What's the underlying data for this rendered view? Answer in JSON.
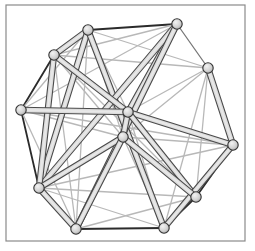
{
  "figure": {
    "background_color": "#ffffff",
    "frame": {
      "stroke_color": "#8a8a8a",
      "stroke_width": 1.2,
      "x": 6,
      "y": 5,
      "width": 239,
      "height": 236
    },
    "canvas": {
      "width": 255,
      "height": 251
    }
  },
  "style": {
    "node_fill": "#d2d2d2",
    "node_stroke": "#333333",
    "node_radius": 5.2,
    "node_stroke_width": 1.1,
    "edge_dark": "#2b2b2b",
    "edge_mid": "#777777",
    "edge_light": "#b8b8b8",
    "edge_highlight": "#e8e8e8",
    "edge_thick_width": 6.5,
    "edge_thin_width": 1.3
  },
  "graph_data": {
    "type": "graph",
    "node_count": 12,
    "edge_count": 44,
    "nodes": [
      {
        "id": "n0",
        "label": "0",
        "x": 88,
        "y": 30
      },
      {
        "id": "n1",
        "label": "1",
        "x": 177,
        "y": 24
      },
      {
        "id": "n2",
        "label": "2",
        "x": 54,
        "y": 55
      },
      {
        "id": "n3",
        "label": "3",
        "x": 208,
        "y": 68
      },
      {
        "id": "n4",
        "label": "4",
        "x": 21,
        "y": 110
      },
      {
        "id": "n5",
        "label": "5",
        "x": 128,
        "y": 112
      },
      {
        "id": "n6",
        "label": "6",
        "x": 123,
        "y": 137
      },
      {
        "id": "n7",
        "label": "7",
        "x": 233,
        "y": 145
      },
      {
        "id": "n8",
        "label": "8",
        "x": 39,
        "y": 188
      },
      {
        "id": "n9",
        "label": "9",
        "x": 196,
        "y": 197
      },
      {
        "id": "n10",
        "label": "10",
        "x": 76,
        "y": 229
      },
      {
        "id": "n11",
        "label": "11",
        "x": 164,
        "y": 228
      }
    ],
    "edges": [
      {
        "from": "n0",
        "to": "n1",
        "tone": "dark",
        "weight": "thin"
      },
      {
        "from": "n0",
        "to": "n2",
        "tone": "mid",
        "weight": "thick"
      },
      {
        "from": "n2",
        "to": "n4",
        "tone": "dark",
        "weight": "thin"
      },
      {
        "from": "n4",
        "to": "n8",
        "tone": "dark",
        "weight": "thin"
      },
      {
        "from": "n8",
        "to": "n10",
        "tone": "mid",
        "weight": "thick"
      },
      {
        "from": "n10",
        "to": "n11",
        "tone": "dark",
        "weight": "thin"
      },
      {
        "from": "n11",
        "to": "n9",
        "tone": "dark",
        "weight": "thin"
      },
      {
        "from": "n9",
        "to": "n7",
        "tone": "dark",
        "weight": "thin"
      },
      {
        "from": "n7",
        "to": "n3",
        "tone": "mid",
        "weight": "thick"
      },
      {
        "from": "n3",
        "to": "n1",
        "tone": "mid",
        "weight": "thin"
      },
      {
        "from": "n0",
        "to": "n3",
        "tone": "light",
        "weight": "thin"
      },
      {
        "from": "n0",
        "to": "n5",
        "tone": "light",
        "weight": "thin"
      },
      {
        "from": "n0",
        "to": "n6",
        "tone": "light",
        "weight": "thin"
      },
      {
        "from": "n0",
        "to": "n8",
        "tone": "mid",
        "weight": "thick"
      },
      {
        "from": "n0",
        "to": "n10",
        "tone": "light",
        "weight": "thin"
      },
      {
        "from": "n0",
        "to": "n11",
        "tone": "mid",
        "weight": "thick"
      },
      {
        "from": "n1",
        "to": "n2",
        "tone": "light",
        "weight": "thin"
      },
      {
        "from": "n1",
        "to": "n5",
        "tone": "mid",
        "weight": "thick"
      },
      {
        "from": "n1",
        "to": "n6",
        "tone": "light",
        "weight": "thin"
      },
      {
        "from": "n1",
        "to": "n8",
        "tone": "mid",
        "weight": "thick"
      },
      {
        "from": "n1",
        "to": "n10",
        "tone": "mid",
        "weight": "thick"
      },
      {
        "from": "n2",
        "to": "n5",
        "tone": "mid",
        "weight": "thick"
      },
      {
        "from": "n2",
        "to": "n6",
        "tone": "light",
        "weight": "thin"
      },
      {
        "from": "n2",
        "to": "n8",
        "tone": "mid",
        "weight": "thick"
      },
      {
        "from": "n2",
        "to": "n9",
        "tone": "light",
        "weight": "thin"
      },
      {
        "from": "n2",
        "to": "n3",
        "tone": "light",
        "weight": "thin"
      },
      {
        "from": "n3",
        "to": "n5",
        "tone": "light",
        "weight": "thin"
      },
      {
        "from": "n3",
        "to": "n6",
        "tone": "light",
        "weight": "thin"
      },
      {
        "from": "n3",
        "to": "n9",
        "tone": "light",
        "weight": "thin"
      },
      {
        "from": "n3",
        "to": "n11",
        "tone": "light",
        "weight": "thin"
      },
      {
        "from": "n4",
        "to": "n5",
        "tone": "mid",
        "weight": "thick"
      },
      {
        "from": "n4",
        "to": "n6",
        "tone": "light",
        "weight": "thin"
      },
      {
        "from": "n4",
        "to": "n10",
        "tone": "light",
        "weight": "thin"
      },
      {
        "from": "n4",
        "to": "n0",
        "tone": "light",
        "weight": "thin"
      },
      {
        "from": "n4",
        "to": "n1",
        "tone": "light",
        "weight": "thin"
      },
      {
        "from": "n5",
        "to": "n6",
        "tone": "mid",
        "weight": "thick"
      },
      {
        "from": "n5",
        "to": "n7",
        "tone": "mid",
        "weight": "thick"
      },
      {
        "from": "n5",
        "to": "n9",
        "tone": "mid",
        "weight": "thick"
      },
      {
        "from": "n5",
        "to": "n11",
        "tone": "light",
        "weight": "thin"
      },
      {
        "from": "n6",
        "to": "n7",
        "tone": "light",
        "weight": "thin"
      },
      {
        "from": "n6",
        "to": "n8",
        "tone": "mid",
        "weight": "thick"
      },
      {
        "from": "n6",
        "to": "n10",
        "tone": "mid",
        "weight": "thick"
      },
      {
        "from": "n6",
        "to": "n11",
        "tone": "light",
        "weight": "thin"
      },
      {
        "from": "n7",
        "to": "n11",
        "tone": "mid",
        "weight": "thick"
      },
      {
        "from": "n7",
        "to": "n8",
        "tone": "light",
        "weight": "thin"
      },
      {
        "from": "n8",
        "to": "n11",
        "tone": "light",
        "weight": "thin"
      },
      {
        "from": "n8",
        "to": "n9",
        "tone": "light",
        "weight": "thin"
      },
      {
        "from": "n9",
        "to": "n10",
        "tone": "light",
        "weight": "thin"
      },
      {
        "from": "n4",
        "to": "n7",
        "tone": "light",
        "weight": "thin"
      },
      {
        "from": "n2",
        "to": "n10",
        "tone": "light",
        "weight": "thin"
      },
      {
        "from": "n9",
        "to": "n6",
        "tone": "mid",
        "weight": "thick"
      }
    ]
  }
}
